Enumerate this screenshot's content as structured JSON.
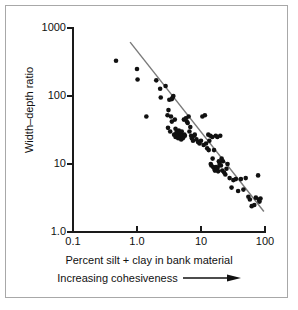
{
  "chart_data": {
    "type": "scatter",
    "title": "",
    "xlabel": "Percent silt + clay in bank material",
    "xsublabel": "Increasing cohesiveness",
    "ylabel": "Width–depth ratio",
    "xscale": "log",
    "yscale": "log",
    "xlim": [
      0.1,
      100
    ],
    "ylim": [
      1.0,
      1000
    ],
    "grid": false,
    "legend": null,
    "xticks": [
      0.1,
      1.0,
      10,
      100
    ],
    "xticklabels": [
      "0.1",
      "1.0",
      "10",
      "100"
    ],
    "yticks": [
      1.0,
      10,
      100,
      1000
    ],
    "yticklabels": [
      "1.0",
      "10",
      "100",
      "1000"
    ],
    "marker": {
      "shape": "circle",
      "color": "#111111",
      "size_px": 4.6
    },
    "trendline": {
      "name": "regression line",
      "color": "#7a7a7a",
      "width_px": 1.4,
      "x_start": 0.78,
      "y_start": 620,
      "x_end": 96,
      "y_end": 2.0
    },
    "x": [
      0.47,
      1.0,
      1.02,
      1.4,
      2.0,
      2.3,
      2.35,
      2.8,
      3.0,
      3.05,
      3.1,
      3.2,
      3.3,
      3.4,
      3.5,
      3.5,
      3.6,
      3.7,
      3.8,
      3.9,
      4.0,
      4.0,
      4.1,
      4.2,
      4.3,
      4.4,
      4.5,
      4.5,
      4.6,
      4.7,
      4.8,
      4.8,
      4.9,
      5.0,
      5.0,
      5.1,
      5.2,
      5.3,
      5.4,
      5.5,
      5.6,
      5.8,
      6.0,
      6.2,
      6.4,
      6.6,
      6.8,
      7.0,
      7.2,
      7.5,
      7.8,
      8.0,
      8.5,
      9.0,
      9.5,
      10.0,
      10.5,
      11.0,
      11.5,
      12.0,
      12.5,
      13.0,
      13.2,
      13.5,
      14.0,
      14.2,
      14.5,
      15.0,
      15.2,
      15.5,
      16.0,
      16.2,
      16.5,
      17.0,
      17.2,
      17.5,
      18.0,
      18.2,
      18.5,
      19.0,
      19.5,
      20.0,
      20.5,
      21.0,
      21.5,
      22.0,
      23.0,
      24.0,
      25.0,
      26.0,
      28.0,
      30.0,
      32.0,
      35.0,
      38.0,
      42.0,
      46.0,
      50.0,
      55.0,
      58.0,
      62.0,
      68.0,
      72.0,
      78.0,
      80.0,
      82.0,
      85.0
    ],
    "y": [
      330,
      250,
      175,
      50,
      170,
      128,
      95,
      140,
      52,
      34,
      62,
      88,
      30,
      50,
      90,
      42,
      95,
      100,
      27,
      45,
      33,
      25,
      28,
      30,
      26,
      24,
      27,
      31,
      29,
      25,
      26,
      28,
      23,
      27,
      30,
      26,
      24,
      25,
      45,
      27,
      26,
      47,
      42,
      40,
      50,
      30,
      35,
      26,
      24,
      22,
      26,
      27,
      23,
      21,
      20,
      22,
      50,
      19,
      52,
      20,
      17,
      27,
      16,
      22,
      26,
      10,
      9.5,
      25,
      12,
      9.0,
      16,
      8.5,
      8.0,
      26,
      9.0,
      8.2,
      25,
      8.8,
      7.8,
      11,
      10,
      26,
      9.5,
      12,
      8.0,
      11,
      7.5,
      7.0,
      8.5,
      10,
      6.2,
      4.5,
      5.8,
      6.0,
      4.0,
      6.0,
      4.2,
      6.2,
      3.3,
      3.0,
      2.4,
      2.5,
      3.2,
      6.8,
      3.0,
      2.8,
      3.1
    ]
  }
}
